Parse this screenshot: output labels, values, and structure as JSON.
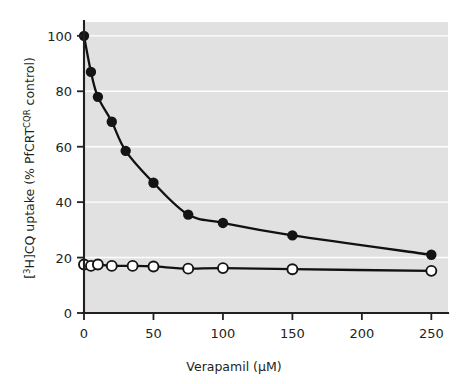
{
  "chart_data": {
    "type": "line",
    "title": "",
    "xlabel": "Verapamil (µM)",
    "ylabel": "[³H]CQ uptake (% PfCRTᶜǫᴿ control)",
    "ylabel_parts": {
      "prefix": "[",
      "iso_sup": "3",
      "mid": "H]CQ uptake (% PfCRT",
      "geno_sup": "CQR",
      "suffix": " control)"
    },
    "xlabel_parts": {
      "text": "Verapamil (",
      "unit": "µM",
      "close": ")"
    },
    "xlim": [
      0,
      262
    ],
    "ylim": [
      0,
      105
    ],
    "xticks": [
      0,
      50,
      100,
      150,
      200,
      250
    ],
    "yticks": [
      0,
      20,
      40,
      60,
      80,
      100
    ],
    "gridlines": [
      20,
      40,
      60,
      80,
      100
    ],
    "grid": true,
    "grid_color": "#ffffff",
    "plot_background": "#e1e1e1",
    "line_color": "#141414",
    "legend": "none",
    "series": [
      {
        "name": "filled-circles",
        "marker": "filled-circle",
        "x": [
          0,
          5,
          10,
          20,
          30,
          50,
          75,
          100,
          150,
          250
        ],
        "values": [
          100,
          87,
          78,
          69,
          58.5,
          47,
          35.5,
          32.5,
          28,
          21
        ]
      },
      {
        "name": "open-circles",
        "marker": "open-circle",
        "x": [
          0,
          5,
          10,
          20,
          35,
          50,
          75,
          100,
          150,
          250
        ],
        "values": [
          17.5,
          17,
          17.5,
          17,
          17,
          16.8,
          16,
          16.2,
          15.8,
          15.2
        ]
      }
    ]
  }
}
